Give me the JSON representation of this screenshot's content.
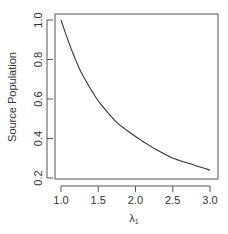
{
  "chart_data": {
    "type": "line",
    "title": "",
    "xlabel": "λ1",
    "xlabel_main": "λ",
    "xlabel_sub": "1",
    "ylabel": "Source Population",
    "xlim": [
      1.0,
      3.0
    ],
    "ylim": [
      0.2,
      1.0
    ],
    "x_ticks": [
      "1.0",
      "1.5",
      "2.0",
      "2.5",
      "3.0"
    ],
    "y_ticks": [
      "0.2",
      "0.4",
      "0.6",
      "0.8",
      "1.0"
    ],
    "grid": false,
    "legend": null,
    "series": [
      {
        "name": "Source Population",
        "x": [
          1.0,
          1.25,
          1.5,
          1.75,
          2.0,
          2.25,
          2.5,
          2.75,
          3.0
        ],
        "y": [
          1.0,
          0.75,
          0.59,
          0.48,
          0.41,
          0.35,
          0.3,
          0.27,
          0.24
        ]
      }
    ]
  }
}
